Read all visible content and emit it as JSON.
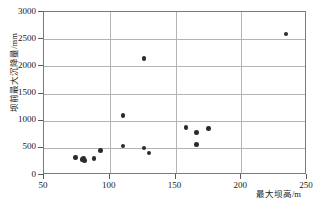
{
  "chart_data": {
    "type": "scatter",
    "title": "",
    "xlabel": "最大坝高/m",
    "ylabel": "坝前最大沉降量/mm",
    "xlim": [
      50,
      250
    ],
    "ylim": [
      0,
      3000
    ],
    "xticks": [
      "50",
      "100",
      "150",
      "200",
      "250"
    ],
    "xtick_values": [
      50,
      100,
      150,
      200,
      250
    ],
    "yticks": [
      "0",
      "500",
      "1000",
      "1500",
      "2000",
      "2500",
      "3000"
    ],
    "ytick_values": [
      0,
      500,
      1000,
      1500,
      2000,
      2500,
      3000
    ],
    "grid": "both",
    "legend": "none",
    "marker_color": "#2b2b2b",
    "gridline_color": "#b4b4b4",
    "frame_color": "#7a7a7a",
    "series": [
      {
        "name": "坝前最大沉降量",
        "points": [
          {
            "x": 74,
            "y": 320
          },
          {
            "x": 79,
            "y": 280
          },
          {
            "x": 80,
            "y": 300
          },
          {
            "x": 81,
            "y": 270
          },
          {
            "x": 88,
            "y": 300
          },
          {
            "x": 93,
            "y": 450
          },
          {
            "x": 110,
            "y": 1100
          },
          {
            "x": 110,
            "y": 535
          },
          {
            "x": 126,
            "y": 2140
          },
          {
            "x": 126,
            "y": 495
          },
          {
            "x": 130,
            "y": 405
          },
          {
            "x": 158,
            "y": 875
          },
          {
            "x": 166,
            "y": 785
          },
          {
            "x": 166,
            "y": 560
          },
          {
            "x": 175,
            "y": 860
          },
          {
            "x": 234,
            "y": 2595
          }
        ]
      }
    ]
  }
}
